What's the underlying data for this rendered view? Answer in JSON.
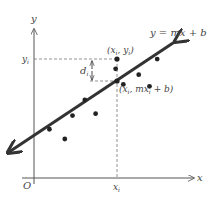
{
  "diagram": {
    "equation_label": "y = mx + b",
    "observed_point_label": "(x_i, y_i)",
    "observed_point_text": "(x",
    "observed_point_sub": "i",
    "observed_point_mid": ", y",
    "observed_point_end": ")",
    "fitted_point_text": "(x",
    "fitted_point_mid": ", mx",
    "fitted_point_end": " + b)",
    "residual_label": "d",
    "residual_sub": "i",
    "x_axis_label": "x",
    "y_axis_label": "y",
    "origin_label": "O",
    "x_tick_label": "x",
    "x_tick_sub": "i",
    "y_tick_label": "y",
    "y_tick_sub": "i",
    "line_color": "#333333",
    "axis_color": "#555555",
    "guide_color": "#777777",
    "scatter_points": [
      {
        "x": 1.0,
        "y": 2.5
      },
      {
        "x": 2.0,
        "y": 2.0
      },
      {
        "x": 2.5,
        "y": 3.2
      },
      {
        "x": 3.3,
        "y": 4.0
      },
      {
        "x": 4.0,
        "y": 3.3
      },
      {
        "x": 5.3,
        "y": 5.6
      },
      {
        "x": 5.8,
        "y": 4.8
      },
      {
        "x": 6.8,
        "y": 5.3
      },
      {
        "x": 7.5,
        "y": 4.7
      },
      {
        "x": 8.0,
        "y": 6.1
      }
    ]
  }
}
